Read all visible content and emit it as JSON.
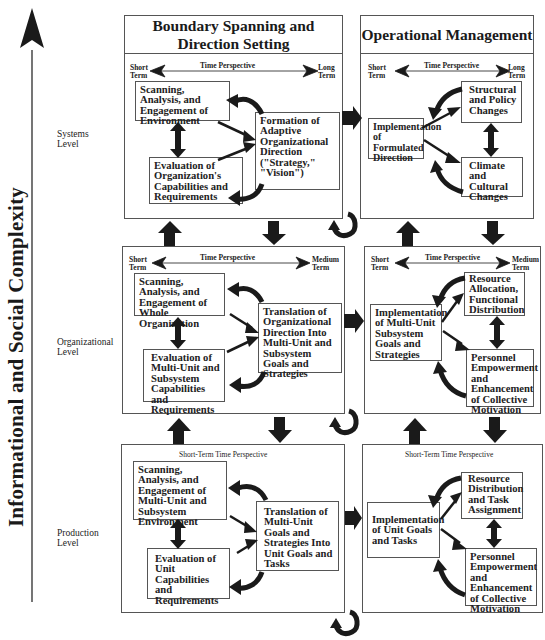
{
  "axis": {
    "label": "Informational and Social Complexity",
    "direction": "up"
  },
  "columns": [
    {
      "title": "Boundary Spanning and Direction Setting"
    },
    {
      "title": "Operational Management"
    }
  ],
  "levels": [
    {
      "label": "Systems Level",
      "label_lines": [
        "Systems",
        "Level"
      ],
      "left": {
        "time_perspective": {
          "title": "Time Perspective",
          "start": [
            "Short",
            "Term"
          ],
          "end": [
            "Long",
            "Term"
          ]
        },
        "boxes": {
          "scanning": "Scanning, Analysis, and Engagement of Environment",
          "evaluation": "Evaluation of Organization's Capabilities and Requirements",
          "center": "Formation of Adaptive Organizational Direction (\"Strategy,\" \"Vision\")"
        }
      },
      "right": {
        "time_perspective": {
          "title": "Time Perspective",
          "start": [
            "Short",
            "Term"
          ],
          "end": [
            "Long",
            "Term"
          ]
        },
        "boxes": {
          "implementation": "Implementation of Formulated Direction",
          "upper": "Structural and Policy Changes",
          "lower": "Climate and Cultural Changes"
        }
      }
    },
    {
      "label": "Organizational Level",
      "label_lines": [
        "Organizational",
        "Level"
      ],
      "left": {
        "time_perspective": {
          "title": "Time Perspective",
          "start": [
            "Short",
            "Term"
          ],
          "end": [
            "Medium",
            "Term"
          ]
        },
        "boxes": {
          "scanning": "Scanning, Analysis, and Engagement of Whole Organization",
          "evaluation": "Evaluation of Multi-Unit and Subsystem Capabilities and Requirements",
          "center": "Translation of Organizational Direction Into Multi-Unit and Subsystem Goals and Strategies"
        }
      },
      "right": {
        "time_perspective": {
          "title": "Time Perspective",
          "start": [
            "Short",
            "Term"
          ],
          "end": [
            "Medium",
            "Term"
          ]
        },
        "boxes": {
          "implementation": "Implementation of Multi-Unit Subsystem Goals and Strategies",
          "upper": "Resource Allocation, Functional Distribution",
          "lower": "Personnel Empowerment and Enhancement of Collective Motivation"
        }
      }
    },
    {
      "label": "Production Level",
      "label_lines": [
        "Production",
        "Level"
      ],
      "left": {
        "time_perspective": {
          "title": "Short-Term Time Perspective"
        },
        "boxes": {
          "scanning": "Scanning, Analysis, and Engagement of Multi-Unit and Subsystem Environment",
          "evaluation": "Evaluation of Unit Capabilities and Requirements",
          "center": "Translation of Multi-Unit Goals and Strategies Into Unit Goals and Tasks"
        }
      },
      "right": {
        "time_perspective": {
          "title": "Short-Term Time Perspective"
        },
        "boxes": {
          "implementation": "Implementation of Unit Goals and Tasks",
          "upper": "Resource Distribution and Task Assignment",
          "lower": "Personnel Empowerment and Enhancement of Collective Motivation"
        }
      }
    }
  ],
  "colors": {
    "arrow": "#1a1a1a",
    "border": "#555555",
    "text": "#1a1a1a",
    "background": "#ffffff"
  }
}
